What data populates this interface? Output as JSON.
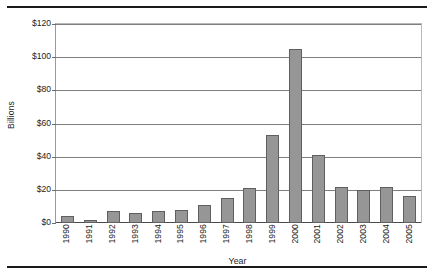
{
  "chart_data": {
    "type": "bar",
    "title": "",
    "xlabel": "Year",
    "ylabel": "Billions",
    "categories": [
      "1990",
      "1991",
      "1992",
      "1993",
      "1994",
      "1995",
      "1996",
      "1997",
      "1998",
      "1999",
      "2000",
      "2001",
      "2002",
      "2003",
      "2004",
      "2005"
    ],
    "values": [
      4,
      2,
      7,
      6,
      7,
      8,
      11,
      15,
      21,
      53,
      105,
      41,
      22,
      20,
      21.5,
      16.5
    ],
    "ylim": [
      0,
      120
    ],
    "ytick_step": 20,
    "ytick_labels": [
      "$0",
      "$20",
      "$40",
      "$60",
      "$80",
      "$100",
      "$120"
    ],
    "ytick_values": [
      0,
      20,
      40,
      60,
      80,
      100,
      120
    ],
    "grid": "horizontal",
    "legend": "none",
    "bar_color": "#969696",
    "bar_border_color": "#5f5f5f",
    "gridline_color": "#7e7e7e",
    "axis_color": "#4a4a4a",
    "rule_color": "#1a1a1a"
  }
}
